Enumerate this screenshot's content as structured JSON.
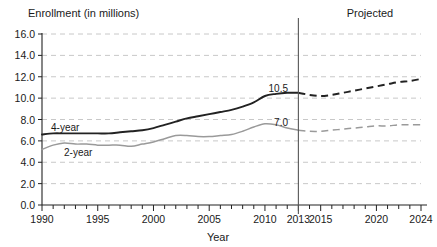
{
  "chart_data": {
    "type": "line",
    "title": "Enrollment (in millions)",
    "xlabel": "Year",
    "ylabel": "",
    "xlim": [
      1990,
      2024
    ],
    "ylim": [
      0.0,
      16.0
    ],
    "ytick_step": 2.0,
    "grid": true,
    "legend_position": "inline-annotations",
    "annotations": {
      "projected_label": "Projected",
      "divider_year": 2013,
      "divider_label": "2013",
      "value_4year_2013": "10.5",
      "value_2year_2013": "7.0"
    },
    "ytick_labels": [
      "0.0",
      "2.0",
      "4.0",
      "6.0",
      "8.0",
      "10.0",
      "12.0",
      "14.0",
      "16.0"
    ],
    "ytick_values": [
      0.0,
      2.0,
      4.0,
      6.0,
      8.0,
      10.0,
      12.0,
      14.0,
      16.0
    ],
    "xtick_labels": [
      "1990",
      "1995",
      "2000",
      "2005",
      "2010",
      "2013",
      "2015",
      "2020",
      "2024"
    ],
    "xtick_values": [
      1990,
      1995,
      2000,
      2005,
      2010,
      2013,
      2015,
      2020,
      2024
    ],
    "x": [
      1990,
      1991,
      1992,
      1993,
      1994,
      1995,
      1996,
      1997,
      1998,
      1999,
      2000,
      2001,
      2002,
      2003,
      2004,
      2005,
      2006,
      2007,
      2008,
      2009,
      2010,
      2011,
      2012,
      2013,
      2014,
      2015,
      2016,
      2017,
      2018,
      2019,
      2020,
      2021,
      2022,
      2023,
      2024
    ],
    "series": [
      {
        "name": "4-year",
        "label": "4-year",
        "color": "#222222",
        "style_actual": "solid",
        "style_projected": "dashed",
        "values": [
          6.6,
          6.7,
          6.7,
          6.7,
          6.7,
          6.7,
          6.7,
          6.8,
          6.9,
          7.0,
          7.2,
          7.5,
          7.8,
          8.1,
          8.3,
          8.5,
          8.7,
          8.9,
          9.2,
          9.6,
          10.2,
          10.4,
          10.5,
          10.5,
          10.3,
          10.2,
          10.3,
          10.5,
          10.7,
          10.9,
          11.1,
          11.3,
          11.5,
          11.6,
          11.8
        ]
      },
      {
        "name": "2-year",
        "label": "2-year",
        "color": "#9a9a9a",
        "style_actual": "solid",
        "style_projected": "dashed",
        "values": [
          5.2,
          5.6,
          5.8,
          5.7,
          5.7,
          5.6,
          5.6,
          5.6,
          5.5,
          5.7,
          5.9,
          6.2,
          6.5,
          6.5,
          6.4,
          6.4,
          6.5,
          6.6,
          6.9,
          7.3,
          7.6,
          7.5,
          7.2,
          7.0,
          6.9,
          6.9,
          7.0,
          7.1,
          7.2,
          7.3,
          7.4,
          7.4,
          7.5,
          7.5,
          7.5
        ]
      }
    ]
  }
}
